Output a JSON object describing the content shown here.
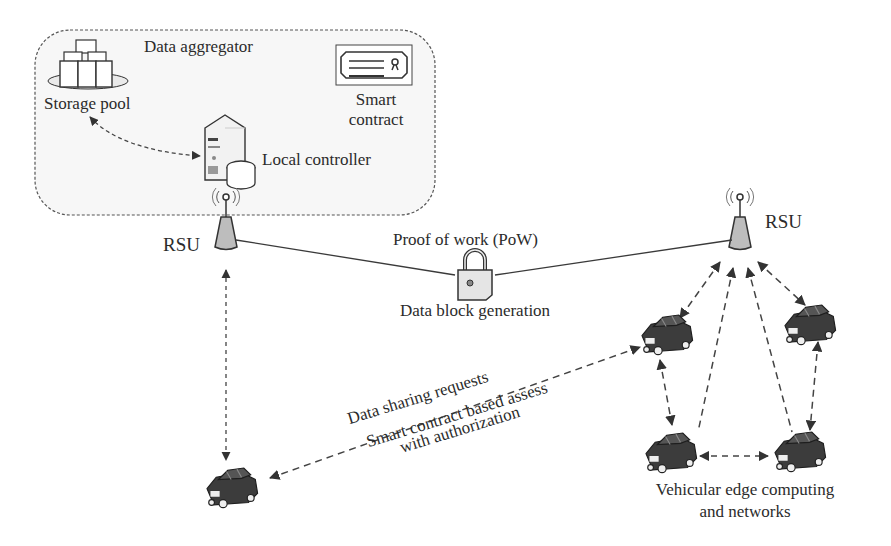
{
  "diagram": {
    "aggregator": {
      "title": "Data aggregator",
      "storage_pool": "Storage pool",
      "smart_contract_line1": "Smart",
      "smart_contract_line2": "contract",
      "local_controller": "Local controller"
    },
    "rsu_left": "RSU",
    "rsu_right": "RSU",
    "pow_label": "Proof of work (PoW)",
    "block_label": "Data block generation",
    "request_label": "Data sharing requests",
    "assess_line1": "Smart contract based assess",
    "assess_line2": "with authorization",
    "vec_line1": "Vehicular edge computing",
    "vec_line2": "and networks"
  },
  "icons": {
    "storage": "storage-pool-icon",
    "server": "server-icon",
    "contract": "certificate-icon",
    "antenna": "rsu-antenna-icon",
    "lock": "padlock-icon",
    "car": "car-icon"
  },
  "colors": {
    "line": "#3a3a3a",
    "dash": "#444444",
    "rsu_fill": "#bdbdbd",
    "car_fill": "#3c3c3c"
  }
}
